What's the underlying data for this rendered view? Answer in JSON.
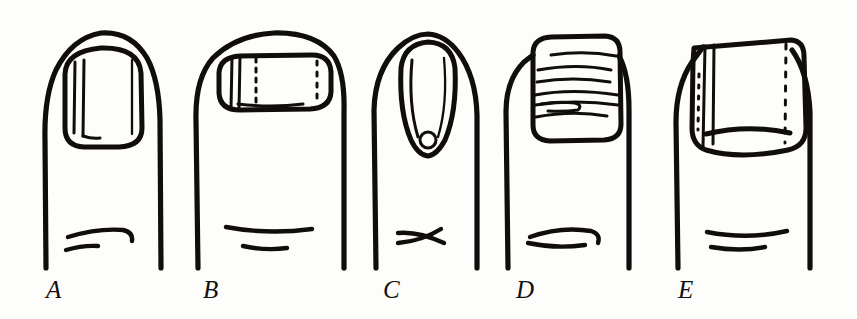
{
  "figure": {
    "kind": "line-drawing-plate",
    "medium": "pen-and-ink illustration",
    "background_color": "#fdfdfb",
    "ink_color": "#100d0c",
    "panel_count": 5,
    "label_style": "italic serif capitals",
    "width_px": 857,
    "height_px": 319
  },
  "panels": [
    {
      "label": "A",
      "label_x": 46,
      "label_y": 277,
      "nail_shape": "rounded-rectangular nail, slightly longer than wide",
      "markings": "two close-set longitudinal ridge lines down the left third of the nail plate, with a short hook at the lower end",
      "finger_shape": "straight-sided finger with domed tip",
      "crease": "two short curved knuckle-crease strokes, upper stroke hooking downward at its right end",
      "finger_left_x": 44,
      "finger_right_x": 161
    },
    {
      "label": "B",
      "label_x": 203,
      "label_y": 277,
      "nail_shape": "broad flat nail, much wider than long",
      "markings": "a pair of solid longitudinal lines near the left edge plus two dotted longitudinal lines, one at the left-centre and one near the right edge",
      "finger_shape": "wide blunt finger with a flattened broad tip",
      "crease": "two short nearly-straight knuckle-crease strokes",
      "finger_left_x": 196,
      "finger_right_x": 344
    },
    {
      "label": "C",
      "label_x": 383,
      "label_y": 277,
      "nail_shape": "narrow tapering tubular nail, strongly curved and pointed at the tip",
      "markings": "long longitudinal border lines converging to a small circular mark at the lower end of the nail",
      "finger_shape": "slender finger with a pointed tapering tip",
      "crease": "two knuckle-crease strokes that cross in an X",
      "finger_left_x": 374,
      "finger_right_x": 477
    },
    {
      "label": "D",
      "label_x": 516,
      "label_y": 277,
      "nail_shape": "square nail with rounded corners",
      "markings": "six to seven horizontal transverse ridge lines crossing the nail plate, heaviest in the lower half",
      "finger_shape": "straight-sided finger with a square tip",
      "crease": "a single curved knuckle-crease stroke with a short stroke beneath it",
      "finger_left_x": 506,
      "finger_right_x": 629
    },
    {
      "label": "E",
      "label_x": 678,
      "label_y": 277,
      "nail_shape": "large squarish nail wider than the finger, with a curved overhanging free edge",
      "markings": "a pair of solid longitudinal lines and a dotted line at the left, plus a long dotted longitudinal line near the right edge",
      "finger_shape": "broad finger with a wide spatulate nail overlapping the sides",
      "crease": "two short curved knuckle-crease strokes",
      "finger_left_x": 676,
      "finger_right_x": 810
    }
  ],
  "labels": {
    "a": "A",
    "b": "B",
    "c": "C",
    "d": "D",
    "e": "E"
  }
}
